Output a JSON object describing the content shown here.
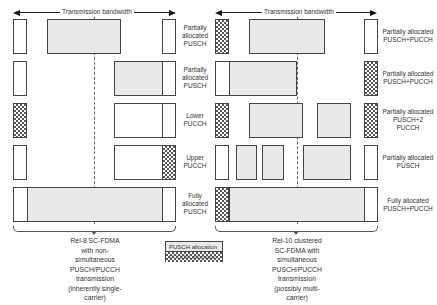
{
  "diagram": {
    "bandwidth_label": "Transmission bandwidth",
    "left_panel": {
      "caption": [
        "Rel-8 SC-FDMA",
        "with non-",
        "simultaneous",
        "PUSCH/PUCCH",
        "transmission",
        "(inherently single-",
        "carrier)"
      ],
      "rows": [
        {
          "label": [
            "Partially",
            "allocated",
            "PUSCH"
          ]
        },
        {
          "label": [
            "Partially",
            "allocated",
            "PUSCH"
          ]
        },
        {
          "label": [
            "Lower",
            "PUCCH"
          ]
        },
        {
          "label": [
            "Upper",
            "PUCCH"
          ]
        },
        {
          "label": [
            "Fully",
            "allocated",
            "PUSCH"
          ]
        }
      ]
    },
    "right_panel": {
      "caption": [
        "Rel-10 clustered",
        "SC-FDMA with",
        "simultaneous",
        "PUSCH/PUCCH",
        "transmission",
        "(possibly multi-",
        "carrier)"
      ],
      "rows": [
        {
          "label": [
            "Partially allocated",
            "PUSCH+PUCCH"
          ]
        },
        {
          "label": [
            "Partially allocated",
            "PUSCH+PUCCH"
          ]
        },
        {
          "label": [
            "Partially allocated",
            "PUSCH+2",
            "PUCCH"
          ]
        },
        {
          "label": [
            "Partially allocated",
            "PUSCH"
          ]
        },
        {
          "label": [
            "Fully allocated",
            "PUSCH+PUCCH"
          ]
        }
      ]
    },
    "legend": {
      "pusch": "PUSCH allocation",
      "pucch": "PUCCH allocation"
    },
    "colors": {
      "pusch_fill": "#e9e9e9",
      "pucch_pattern": "#555555",
      "outline": "#444444"
    }
  }
}
